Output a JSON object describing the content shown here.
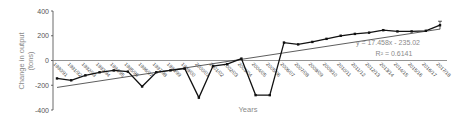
{
  "chart_data": {
    "type": "line",
    "title": "",
    "xlabel": "Years",
    "ylabel": "Change in output (tons)",
    "ylabel_line1": "Change in output",
    "ylabel_line2": "(tons)",
    "ylim": [
      -400,
      400
    ],
    "yticks": [
      400,
      200,
      0,
      -200,
      -400
    ],
    "ytick_labels": [
      "400",
      "200",
      "0",
      "-200",
      "-400"
    ],
    "grid": false,
    "legend": null,
    "categories": [
      "1990/91",
      "1991/92",
      "1992/93",
      "1993/94",
      "1994/95",
      "1995/96",
      "1996/97",
      "1997/98",
      "1998/99",
      "1999/00",
      "2000/01",
      "2001/02",
      "2002/03",
      "2003/04",
      "2004/05",
      "2005/06",
      "2006/07",
      "2007/08",
      "2008/09",
      "2009/10",
      "2010/11",
      "2011/12",
      "2012/13",
      "2013/14",
      "2014/15",
      "2015/16",
      "2016/17",
      "2017/18"
    ],
    "series": [
      {
        "name": "Change in output",
        "values": [
          -145,
          -160,
          -120,
          -95,
          -80,
          -90,
          -210,
          -95,
          -80,
          -65,
          -300,
          -45,
          -30,
          15,
          -280,
          -280,
          145,
          130,
          150,
          175,
          200,
          215,
          225,
          245,
          235,
          235,
          240,
          285
        ]
      }
    ],
    "trendline": {
      "type": "linear",
      "equation": "y = 17.458x - 235.02",
      "r_squared": "R² = 0.6141",
      "slope": 17.458,
      "intercept": -235.02
    }
  }
}
